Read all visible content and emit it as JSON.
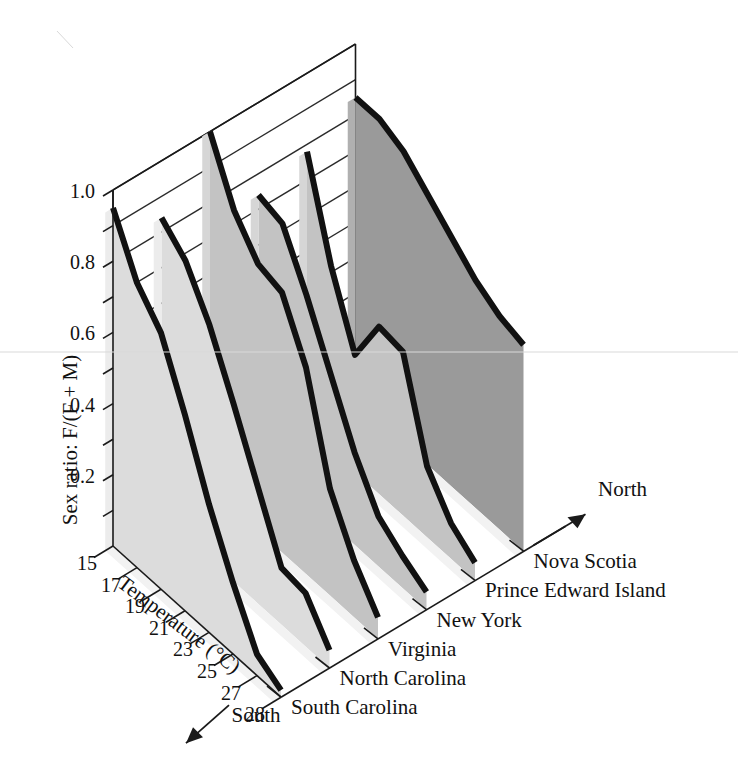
{
  "chart_data": {
    "type": "line",
    "title": "",
    "subtitle": "",
    "ylabel": "Sex ratio: F/(F + M)",
    "xlabel": "Temperature (°C)",
    "zlabel": "",
    "ylim": [
      0.0,
      1.0
    ],
    "yticks": [
      "0.2",
      "0.4",
      "0.6",
      "0.8",
      "1.0"
    ],
    "ytick_values": [
      0.2,
      0.4,
      0.6,
      0.8,
      1.0
    ],
    "xticks": [
      "15",
      "17",
      "19",
      "21",
      "23",
      "25",
      "27",
      "28"
    ],
    "xtick_values": [
      15,
      17,
      19,
      21,
      23,
      25,
      27,
      28
    ],
    "grid": true,
    "legend_position": "none",
    "projection": "3d-ribbon",
    "direction_labels": {
      "near": "South",
      "far": "North"
    },
    "categories": [
      "South Carolina",
      "North Carolina",
      "Virginia",
      "New York",
      "Prince Edward Island",
      "Nova Scotia"
    ],
    "series": [
      {
        "name": "South Carolina",
        "x": [
          15,
          17,
          19,
          21,
          23,
          25,
          27,
          28
        ],
        "values": [
          0.95,
          0.8,
          0.72,
          0.55,
          0.36,
          0.2,
          0.06,
          0.02
        ]
      },
      {
        "name": "North Carolina",
        "x": [
          15,
          17,
          19,
          21,
          23,
          25,
          27,
          28
        ],
        "values": [
          0.84,
          0.78,
          0.66,
          0.5,
          0.33,
          0.16,
          0.15,
          0.05
        ]
      },
      {
        "name": "Virginia",
        "x": [
          15,
          17,
          19,
          21,
          23,
          25,
          27,
          28
        ],
        "values": [
          1.0,
          0.84,
          0.75,
          0.73,
          0.58,
          0.3,
          0.16,
          0.06
        ]
      },
      {
        "name": "New York",
        "x": [
          15,
          17,
          19,
          21,
          23,
          25,
          27,
          28
        ],
        "values": [
          0.74,
          0.72,
          0.58,
          0.42,
          0.26,
          0.14,
          0.09,
          0.05
        ]
      },
      {
        "name": "Prince Edward Island",
        "x": [
          15,
          17,
          19,
          21,
          23,
          25,
          27,
          28
        ],
        "values": [
          0.78,
          0.52,
          0.33,
          0.47,
          0.46,
          0.2,
          0.1,
          0.05
        ]
      },
      {
        "name": "Nova Scotia",
        "x": [
          15,
          17,
          19,
          21,
          23,
          25,
          27,
          28
        ],
        "values": [
          0.85,
          0.85,
          0.82,
          0.76,
          0.7,
          0.64,
          0.6,
          0.58
        ]
      }
    ],
    "colors": {
      "ribbon_front": "#dcdcdc",
      "ribbon_mid": "#c3c3c3",
      "ribbon_back": "#9a9a9a",
      "ribbon_edge": "#111111",
      "axis": "#1a1a1a",
      "background": "#ffffff"
    }
  },
  "axes": {
    "y_axis_title": "Sex ratio: F/(F + M)",
    "x_axis_title": "Temperature (°C)",
    "y_tick_labels": [
      "1.0",
      "0.8",
      "0.6",
      "0.4",
      "0.2"
    ],
    "x_tick_labels": [
      "15",
      "17",
      "19",
      "21",
      "23",
      "25",
      "27",
      "28"
    ]
  },
  "category_labels": [
    "South Carolina",
    "North Carolina",
    "Virginia",
    "New York",
    "Prince Edward Island",
    "Nova Scotia"
  ],
  "direction": {
    "south": "South",
    "north": "North"
  }
}
